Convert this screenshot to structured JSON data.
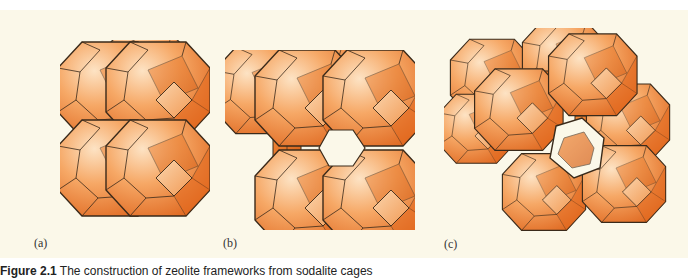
{
  "figure": {
    "background": "#fbf8e9",
    "cage_color": "#f08a3c",
    "cage_light": "#fcd3a8",
    "cage_dark": "#d9621a",
    "edge_color": "#3a2a1a",
    "panels": [
      {
        "label": "(a)",
        "description": "sodalite cages stacked via shared 4-rings (simple cubic packing)"
      },
      {
        "label": "(b)",
        "description": "sodalite cages linked through double 4-rings"
      },
      {
        "label": "(c)",
        "description": "sodalite cages linked through double 6-rings forming a supercage"
      }
    ],
    "caption": {
      "prefix": "Figure 2.1",
      "text": "The construction of zeolite frameworks from sodalite cages"
    }
  }
}
